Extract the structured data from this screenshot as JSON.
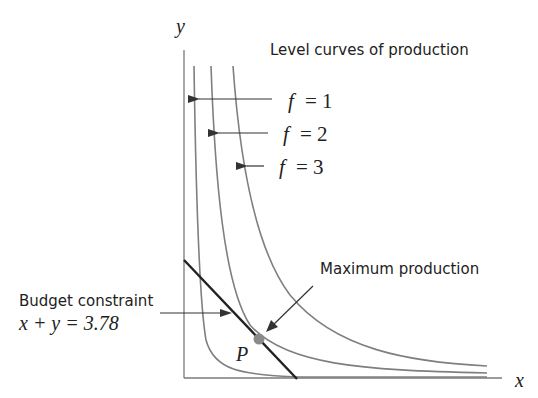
{
  "axes": {
    "x_label": "x",
    "y_label": "y"
  },
  "title": "Level curves of production",
  "level_curves": [
    {
      "f": "f",
      "eq": "= 1"
    },
    {
      "f": "f",
      "eq": "= 2"
    },
    {
      "f": "f",
      "eq": "= 3"
    }
  ],
  "budget": {
    "label": "Budget constraint",
    "lhs": "x + y = 3.78"
  },
  "max_label": "Maximum production",
  "point_label": "P",
  "colors": {
    "axis": "#7a7a7a",
    "curve": "#7f7f7f",
    "budget_line": "#222222",
    "point": "#8a8a8a",
    "arrow": "#333333"
  }
}
